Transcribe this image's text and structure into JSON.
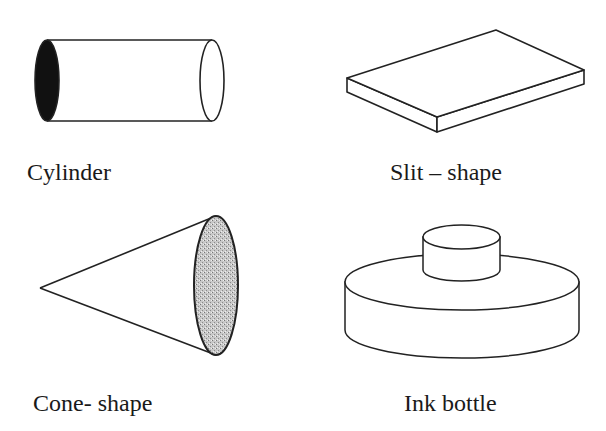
{
  "shapes": [
    {
      "id": "cylinder",
      "label": "Cylinder"
    },
    {
      "id": "slit",
      "label": "Slit – shape"
    },
    {
      "id": "cone",
      "label": "Cone- shape"
    },
    {
      "id": "ink-bottle",
      "label": "Ink bottle"
    }
  ],
  "colors": {
    "stroke": "#222222",
    "fill_dark": "#111111",
    "fill_stipple": "#b8b8b8",
    "background": "#ffffff"
  }
}
